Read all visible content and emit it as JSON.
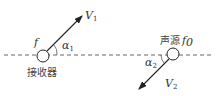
{
  "diagram": {
    "receiver": {
      "label": "接收器",
      "freq_symbol": "f",
      "velocity": {
        "symbol": "V",
        "subscript": "1"
      },
      "angle": {
        "symbol": "α",
        "subscript": "1"
      }
    },
    "source": {
      "label": "声源",
      "freq_symbol": "f",
      "freq_subscript": "0",
      "velocity": {
        "symbol": "V",
        "subscript": "2"
      },
      "angle": {
        "symbol": "α",
        "subscript": "2"
      }
    },
    "colors": {
      "line": "#333333",
      "background": "#ffffff"
    }
  }
}
